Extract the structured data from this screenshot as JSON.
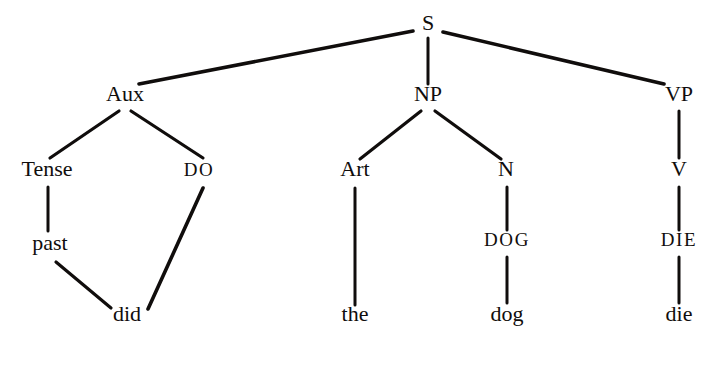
{
  "figure": {
    "type": "syntax-tree-diagram",
    "background_color": "#ffffff",
    "ink_color": "#100d0c",
    "nodes": {
      "s": "S",
      "aux": "Aux",
      "np": "NP",
      "vp": "VP",
      "tense": "Tense",
      "do": "DO",
      "art": "Art",
      "n": "N",
      "v": "V",
      "past": "past",
      "dog_caps": "DOG",
      "die_caps": "DIE",
      "did": "did",
      "the": "the",
      "dog": "dog",
      "die": "die"
    },
    "nodes_list": [
      {
        "id": "s",
        "label": "S",
        "x": 428,
        "y": 30,
        "level": "category"
      },
      {
        "id": "aux",
        "label": "Aux",
        "x": 125,
        "y": 101,
        "level": "category"
      },
      {
        "id": "np",
        "label": "NP",
        "x": 428,
        "y": 101,
        "level": "category"
      },
      {
        "id": "vp",
        "label": "VP",
        "x": 679,
        "y": 101,
        "level": "category"
      },
      {
        "id": "tense",
        "label": "Tense",
        "x": 47,
        "y": 176,
        "level": "category"
      },
      {
        "id": "do",
        "label": "DO",
        "x": 199,
        "y": 176,
        "level": "caps"
      },
      {
        "id": "art",
        "label": "Art",
        "x": 355,
        "y": 176,
        "level": "category"
      },
      {
        "id": "n",
        "label": "N",
        "x": 506,
        "y": 176,
        "level": "category"
      },
      {
        "id": "v",
        "label": "V",
        "x": 679,
        "y": 176,
        "level": "category"
      },
      {
        "id": "past",
        "label": "past",
        "x": 50,
        "y": 250,
        "level": "word"
      },
      {
        "id": "dog_caps",
        "label": "DOG",
        "x": 507,
        "y": 246,
        "level": "caps"
      },
      {
        "id": "die_caps",
        "label": "DIE",
        "x": 679,
        "y": 246,
        "level": "caps"
      },
      {
        "id": "did",
        "label": "did",
        "x": 127,
        "y": 321,
        "level": "word"
      },
      {
        "id": "the",
        "label": "the",
        "x": 355,
        "y": 321,
        "level": "word"
      },
      {
        "id": "dog",
        "label": "dog",
        "x": 507,
        "y": 321,
        "level": "word"
      },
      {
        "id": "die",
        "label": "die",
        "x": 679,
        "y": 321,
        "level": "word"
      }
    ],
    "edges": [
      {
        "from": "s",
        "to": "aux",
        "x1": 413,
        "y1": 31,
        "x2": 139,
        "y2": 84
      },
      {
        "from": "s",
        "to": "np",
        "x1": 428,
        "y1": 38,
        "x2": 428,
        "y2": 84
      },
      {
        "from": "s",
        "to": "vp",
        "x1": 443,
        "y1": 32,
        "x2": 664,
        "y2": 84
      },
      {
        "from": "aux",
        "to": "tense",
        "x1": 119,
        "y1": 111,
        "x2": 50,
        "y2": 158
      },
      {
        "from": "aux",
        "to": "do",
        "x1": 131,
        "y1": 111,
        "x2": 203,
        "y2": 158
      },
      {
        "from": "np",
        "to": "art",
        "x1": 421,
        "y1": 111,
        "x2": 360,
        "y2": 159
      },
      {
        "from": "np",
        "to": "n",
        "x1": 435,
        "y1": 111,
        "x2": 501,
        "y2": 159
      },
      {
        "from": "vp",
        "to": "v",
        "x1": 679,
        "y1": 111,
        "x2": 679,
        "y2": 158
      },
      {
        "from": "tense",
        "to": "past",
        "x1": 48,
        "y1": 187,
        "x2": 48,
        "y2": 231
      },
      {
        "from": "n",
        "to": "dog_caps",
        "x1": 507,
        "y1": 187,
        "x2": 507,
        "y2": 230
      },
      {
        "from": "v",
        "to": "die_caps",
        "x1": 679,
        "y1": 187,
        "x2": 679,
        "y2": 230
      },
      {
        "from": "past",
        "to": "did",
        "x1": 56,
        "y1": 262,
        "x2": 111,
        "y2": 308
      },
      {
        "from": "do",
        "to": "did",
        "x1": 203,
        "y1": 188,
        "x2": 148,
        "y2": 309
      },
      {
        "from": "art",
        "to": "the",
        "x1": 355,
        "y1": 188,
        "x2": 355,
        "y2": 305
      },
      {
        "from": "dog_caps",
        "to": "dog",
        "x1": 507,
        "y1": 257,
        "x2": 507,
        "y2": 303
      },
      {
        "from": "die_caps",
        "to": "die",
        "x1": 679,
        "y1": 257,
        "x2": 679,
        "y2": 303
      }
    ]
  }
}
